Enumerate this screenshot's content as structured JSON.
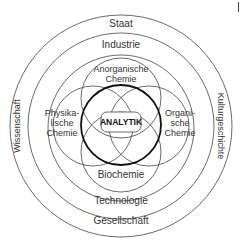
{
  "diagram": {
    "rings": {
      "outer_top": "Staat",
      "outer_bottom": "Gesellschaft",
      "outer_left": "Wissenschaft",
      "outer_right": "Kulturgeschichte",
      "middle_top": "Industrie",
      "middle_bottom": "Technologie"
    },
    "petals": {
      "top": "Anorganische\nChemie",
      "left": "Physika-\nlische\nChemie",
      "right": "Organi-\nsche\nChemie",
      "bottom": "Biochemie"
    },
    "center": "ANALYTIK",
    "colors": {
      "line": "#333333",
      "bold_line": "#111111",
      "text": "#333333"
    }
  }
}
